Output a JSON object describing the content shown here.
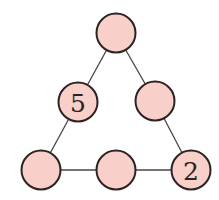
{
  "diagram": {
    "type": "triangle-number-puzzle",
    "colors": {
      "node_fill": "#f8cfc9",
      "node_stroke": "#2b2222",
      "edge": "#4a4444"
    },
    "nodes": [
      {
        "id": "top",
        "label": "",
        "cx": 116,
        "cy": 33
      },
      {
        "id": "mid-left",
        "label": "5",
        "cx": 78,
        "cy": 102
      },
      {
        "id": "mid-right",
        "label": "",
        "cx": 155,
        "cy": 101
      },
      {
        "id": "bottom-left",
        "label": "",
        "cx": 41,
        "cy": 170
      },
      {
        "id": "bottom-middle",
        "label": "",
        "cx": 116,
        "cy": 170
      },
      {
        "id": "bottom-right",
        "label": "2",
        "cx": 191,
        "cy": 170
      }
    ],
    "edges": [
      [
        "top",
        "mid-left"
      ],
      [
        "mid-left",
        "bottom-left"
      ],
      [
        "top",
        "mid-right"
      ],
      [
        "mid-right",
        "bottom-right"
      ],
      [
        "bottom-left",
        "bottom-middle"
      ],
      [
        "bottom-middle",
        "bottom-right"
      ]
    ]
  }
}
